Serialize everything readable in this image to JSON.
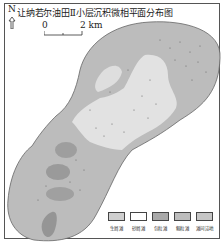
{
  "map": {
    "title": "让纳若尔油田Ⅱ小层沉积微相平面分布图",
    "north_label": "N",
    "scale": {
      "start": "0",
      "end": "2 km"
    }
  },
  "legend": [
    {
      "label": "生屑滩",
      "color": "#cfcfcf"
    },
    {
      "label": "砂屑滩",
      "color": "#ffffff"
    },
    {
      "label": "包粒滩",
      "color": "#a9a9a9"
    },
    {
      "label": "鲕粒滩",
      "color": "#bdbdbd"
    },
    {
      "label": "滩间洼地",
      "color": "#c6c6c6"
    }
  ],
  "colors": {
    "frame": "#555555",
    "outline": "#666666",
    "light_zone": "#e3e3e3",
    "mid_zone": "#bcbcbc",
    "dark_patch": "#9a9a9a"
  }
}
